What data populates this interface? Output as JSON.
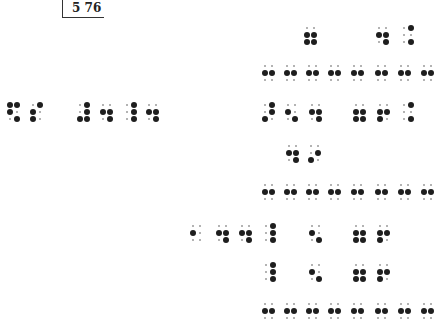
{
  "page": {
    "page_number": "5 76",
    "notation": "braille",
    "dot_color": "#1e1e1e"
  },
  "braille_cells": [
    {
      "row": 1,
      "x": 307,
      "y": 35,
      "dots": [
        2,
        3,
        5,
        6
      ]
    },
    {
      "row": 1,
      "x": 379,
      "y": 35,
      "dots": [
        2,
        5,
        6
      ]
    },
    {
      "row": 1,
      "x": 404,
      "y": 35,
      "dots": [
        4,
        6
      ]
    },
    {
      "row": 2,
      "x": 265,
      "y": 73,
      "dots": [
        2,
        5
      ]
    },
    {
      "row": 2,
      "x": 287,
      "y": 73,
      "dots": [
        2,
        5
      ]
    },
    {
      "row": 2,
      "x": 309,
      "y": 73,
      "dots": [
        2,
        5
      ]
    },
    {
      "row": 2,
      "x": 331,
      "y": 73,
      "dots": [
        2,
        5
      ]
    },
    {
      "row": 2,
      "x": 354,
      "y": 73,
      "dots": [
        2,
        5
      ]
    },
    {
      "row": 2,
      "x": 378,
      "y": 73,
      "dots": [
        2,
        5
      ]
    },
    {
      "row": 2,
      "x": 401,
      "y": 73,
      "dots": [
        2,
        5
      ]
    },
    {
      "row": 2,
      "x": 424,
      "y": 73,
      "dots": [
        2,
        5
      ]
    },
    {
      "row": 3,
      "x": 10,
      "y": 112,
      "dots": [
        1,
        2,
        4,
        6
      ]
    },
    {
      "row": 3,
      "x": 33,
      "y": 112,
      "dots": [
        2,
        3,
        4
      ]
    },
    {
      "row": 3,
      "x": 80,
      "y": 112,
      "dots": [
        3,
        4,
        5,
        6
      ]
    },
    {
      "row": 3,
      "x": 103,
      "y": 112,
      "dots": [
        2,
        5,
        6
      ]
    },
    {
      "row": 3,
      "x": 127,
      "y": 112,
      "dots": [
        4,
        5,
        6
      ]
    },
    {
      "row": 3,
      "x": 149,
      "y": 112,
      "dots": [
        2,
        5,
        6
      ]
    },
    {
      "row": 3,
      "x": 265,
      "y": 112,
      "dots": [
        3,
        4,
        5
      ]
    },
    {
      "row": 3,
      "x": 288,
      "y": 112,
      "dots": [
        2,
        6
      ]
    },
    {
      "row": 3,
      "x": 312,
      "y": 112,
      "dots": [
        2,
        5,
        6
      ]
    },
    {
      "row": 3,
      "x": 356,
      "y": 112,
      "dots": [
        2,
        3,
        5,
        6
      ]
    },
    {
      "row": 3,
      "x": 380,
      "y": 112,
      "dots": [
        2,
        3,
        5
      ]
    },
    {
      "row": 3,
      "x": 404,
      "y": 112,
      "dots": [
        4,
        6
      ]
    },
    {
      "row": 4,
      "x": 289,
      "y": 153,
      "dots": [
        2,
        5,
        6
      ]
    },
    {
      "row": 4,
      "x": 311,
      "y": 153,
      "dots": [
        3,
        5
      ]
    },
    {
      "row": 5,
      "x": 265,
      "y": 192,
      "dots": [
        2,
        5
      ]
    },
    {
      "row": 5,
      "x": 287,
      "y": 192,
      "dots": [
        2,
        5
      ]
    },
    {
      "row": 5,
      "x": 309,
      "y": 192,
      "dots": [
        2,
        5
      ]
    },
    {
      "row": 5,
      "x": 331,
      "y": 192,
      "dots": [
        2,
        5
      ]
    },
    {
      "row": 5,
      "x": 354,
      "y": 192,
      "dots": [
        2,
        5
      ]
    },
    {
      "row": 5,
      "x": 378,
      "y": 192,
      "dots": [
        2,
        5
      ]
    },
    {
      "row": 5,
      "x": 401,
      "y": 192,
      "dots": [
        2,
        5
      ]
    },
    {
      "row": 5,
      "x": 424,
      "y": 192,
      "dots": [
        2,
        5
      ]
    },
    {
      "row": 6,
      "x": 193,
      "y": 233,
      "dots": [
        2
      ]
    },
    {
      "row": 6,
      "x": 219,
      "y": 233,
      "dots": [
        2,
        5,
        6
      ]
    },
    {
      "row": 6,
      "x": 242,
      "y": 233,
      "dots": [
        2,
        5,
        6
      ]
    },
    {
      "row": 6,
      "x": 266,
      "y": 233,
      "dots": [
        4,
        5,
        6
      ]
    },
    {
      "row": 6,
      "x": 312,
      "y": 233,
      "dots": [
        2,
        6
      ]
    },
    {
      "row": 6,
      "x": 356,
      "y": 233,
      "dots": [
        2,
        3,
        5,
        6
      ]
    },
    {
      "row": 6,
      "x": 380,
      "y": 233,
      "dots": [
        2,
        3,
        5
      ]
    },
    {
      "row": 7,
      "x": 266,
      "y": 272,
      "dots": [
        4,
        5,
        6
      ]
    },
    {
      "row": 7,
      "x": 312,
      "y": 272,
      "dots": [
        2,
        6
      ]
    },
    {
      "row": 7,
      "x": 356,
      "y": 272,
      "dots": [
        2,
        3,
        5,
        6
      ]
    },
    {
      "row": 7,
      "x": 380,
      "y": 272,
      "dots": [
        2,
        3,
        5
      ]
    },
    {
      "row": 8,
      "x": 265,
      "y": 311,
      "dots": [
        2,
        5
      ]
    },
    {
      "row": 8,
      "x": 287,
      "y": 311,
      "dots": [
        2,
        5
      ]
    },
    {
      "row": 8,
      "x": 309,
      "y": 311,
      "dots": [
        2,
        5
      ]
    },
    {
      "row": 8,
      "x": 331,
      "y": 311,
      "dots": [
        2,
        5
      ]
    },
    {
      "row": 8,
      "x": 354,
      "y": 311,
      "dots": [
        2,
        5
      ]
    },
    {
      "row": 8,
      "x": 378,
      "y": 311,
      "dots": [
        2,
        5
      ]
    },
    {
      "row": 8,
      "x": 401,
      "y": 311,
      "dots": [
        2,
        5
      ]
    },
    {
      "row": 8,
      "x": 424,
      "y": 311,
      "dots": [
        2,
        5
      ]
    }
  ]
}
